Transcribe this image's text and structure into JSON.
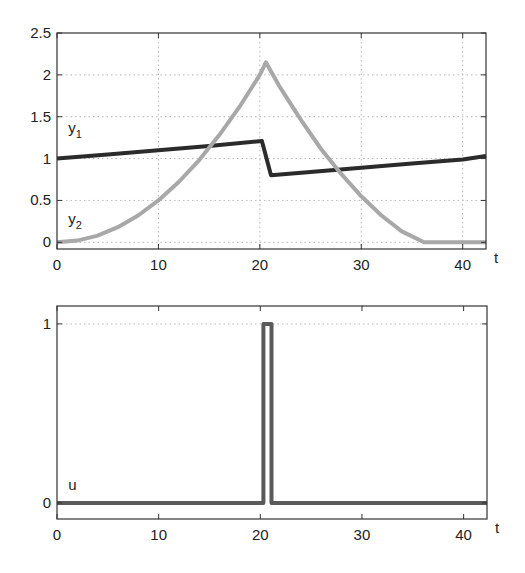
{
  "chart_data": [
    {
      "type": "line",
      "title": "",
      "xlabel": "t",
      "ylabel": "",
      "xlim": [
        0,
        42.3
      ],
      "ylim": [
        -0.08,
        2.5
      ],
      "xticks": [
        0,
        10,
        20,
        30,
        40
      ],
      "xtick_labels": [
        "0",
        "10",
        "20",
        "30",
        "40"
      ],
      "yticks": [
        0,
        0.5,
        1,
        1.5,
        2,
        2.5
      ],
      "ytick_labels": [
        "0",
        "0.5",
        "1",
        "1.5",
        "2",
        "2.5"
      ],
      "grid": true,
      "legend": "none (inline labels)",
      "series": [
        {
          "name": "y1",
          "label": "y",
          "subscript": "1",
          "color": "#2b2b2b",
          "label_pos": [
            1.1,
            1.3
          ],
          "x": [
            0,
            5,
            10,
            15,
            20.2,
            21.1,
            25,
            30,
            35,
            40,
            42.3
          ],
          "y": [
            1.0,
            1.05,
            1.1,
            1.15,
            1.21,
            0.8,
            0.84,
            0.89,
            0.94,
            0.99,
            1.03
          ]
        },
        {
          "name": "y2",
          "label": "y",
          "subscript": "2",
          "color": "#a8a8a8",
          "label_pos": [
            1.1,
            0.22
          ],
          "x": [
            0,
            2,
            4,
            6,
            8,
            10,
            12,
            14,
            16,
            18,
            20,
            20.6,
            22,
            24,
            26,
            28,
            30,
            32,
            34,
            36.2,
            38,
            40,
            42.3
          ],
          "y": [
            0.0,
            0.02,
            0.08,
            0.18,
            0.32,
            0.5,
            0.72,
            0.98,
            1.28,
            1.62,
            2.0,
            2.15,
            1.85,
            1.47,
            1.12,
            0.82,
            0.55,
            0.32,
            0.13,
            0.0,
            0.0,
            0.0,
            0.0
          ]
        }
      ]
    },
    {
      "type": "line",
      "title": "",
      "xlabel": "t",
      "ylabel": "",
      "xlim": [
        0,
        42.3
      ],
      "ylim": [
        -0.09,
        1.1
      ],
      "xticks": [
        0,
        10,
        20,
        30,
        40
      ],
      "xtick_labels": [
        "0",
        "10",
        "20",
        "30",
        "40"
      ],
      "yticks": [
        0,
        1
      ],
      "ytick_labels": [
        "0",
        "1"
      ],
      "grid": "y=1 only (dotted)",
      "legend": "none (inline labels)",
      "series": [
        {
          "name": "u",
          "label": "u",
          "subscript": "",
          "color": "#5a5a5a",
          "label_pos": [
            1.1,
            0.07
          ],
          "x": [
            0,
            20.3,
            20.3,
            21.1,
            21.1,
            42.3
          ],
          "y": [
            0,
            0,
            1,
            1,
            0,
            0
          ]
        }
      ]
    }
  ]
}
